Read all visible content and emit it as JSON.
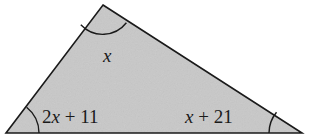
{
  "figure": {
    "kind": "triangle-angle-diagram",
    "background_color": "#ffffff",
    "fill_color": "#c8c8c8",
    "stroke_color": "#1a1a1a",
    "text_color": "#1a1a1a"
  },
  "labels": {
    "apex_angle": "x",
    "left_angle": "2x + 11",
    "right_angle": "x + 21"
  },
  "chart_data": {
    "type": "diagram",
    "title": "",
    "shape": "triangle",
    "vertices": [
      {
        "name": "apex",
        "x": 103,
        "y": 5
      },
      {
        "name": "bottom-left",
        "x": 6,
        "y": 133
      },
      {
        "name": "bottom-right",
        "x": 302,
        "y": 133
      }
    ],
    "angle_markers": [
      {
        "vertex": "apex",
        "radius": 30,
        "label": "x"
      },
      {
        "vertex": "bottom-left",
        "radius": 33,
        "label": "2x + 11"
      },
      {
        "vertex": "bottom-right",
        "radius": 33,
        "label": "x + 21"
      }
    ]
  }
}
